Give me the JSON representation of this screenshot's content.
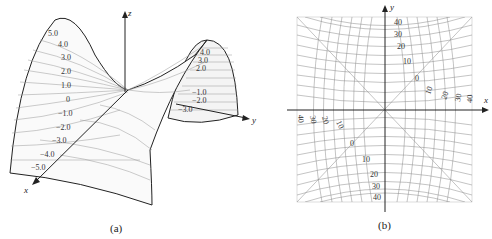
{
  "figure_a": {
    "caption": "(a)",
    "axes": {
      "x": "x",
      "y": "y",
      "z": "z"
    },
    "left_labels": [
      "5.0",
      "4.0",
      "3.0",
      "2.0",
      "1.0",
      "0",
      "−1.0",
      "−2.0",
      "−3.0",
      "−4.0",
      "−5.0"
    ],
    "right_labels": [
      "4.0",
      "3.0",
      "2.0",
      "−1.0",
      "−2.0",
      "−3.0"
    ]
  },
  "figure_b": {
    "caption": "(b)",
    "axes": {
      "x": "x",
      "y": "y"
    },
    "top_labels": [
      "40",
      "30",
      "20",
      "10",
      "0"
    ],
    "bottom_labels": [
      "0",
      "10",
      "20",
      "30",
      "40"
    ],
    "right_labels": [
      "10",
      "20",
      "30",
      "40"
    ],
    "left_labels": [
      "40",
      "30",
      "20",
      "10"
    ]
  }
}
